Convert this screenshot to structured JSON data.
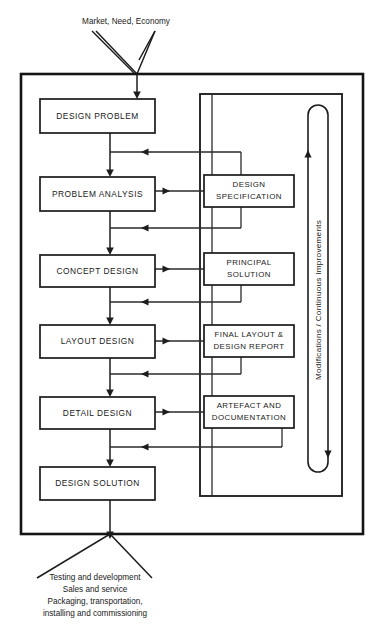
{
  "diagram": {
    "input_label": "Market, Need, Economy",
    "loop_label": "Modifications / Continuous Improvements",
    "colors": {
      "line": "#1d1d1d",
      "frame": "#141414",
      "box_fill": "#ffffff",
      "text": "#1a1a1a",
      "background": "#ffffff"
    },
    "stages": [
      {
        "id": "design-problem",
        "label": "DESIGN PROBLEM"
      },
      {
        "id": "problem-analysis",
        "label": "PROBLEM ANALYSIS"
      },
      {
        "id": "concept-design",
        "label": "CONCEPT DESIGN"
      },
      {
        "id": "layout-design",
        "label": "LAYOUT DESIGN"
      },
      {
        "id": "detail-design",
        "label": "DETAIL DESIGN"
      },
      {
        "id": "design-solution",
        "label": "DESIGN SOLUTION"
      }
    ],
    "outputs": [
      {
        "id": "design-specification",
        "line1": "DESIGN",
        "line2": "SPECIFICATION"
      },
      {
        "id": "principal-solution",
        "line1": "PRINCIPAL",
        "line2": "SOLUTION"
      },
      {
        "id": "final-layout-report",
        "line1": "FINAL LAYOUT &",
        "line2": "DESIGN REPORT"
      },
      {
        "id": "artefact-documentation",
        "line1": "ARTEFACT AND",
        "line2": "DOCUMENTATION"
      }
    ],
    "footer_lines": [
      "Testing and development",
      "Sales and service",
      "Packaging, transportation,",
      "installing and commissioning"
    ]
  }
}
